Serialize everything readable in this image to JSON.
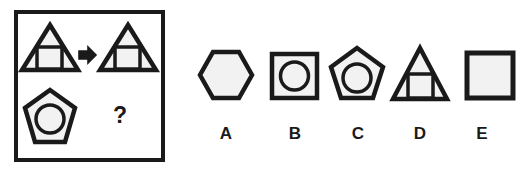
{
  "puzzle": {
    "type": "visual-analogy-matrix",
    "question_mark": "?",
    "stem_box": {
      "x": 14,
      "y": 10,
      "width": 151,
      "height": 152,
      "border_color": "#1a1a1a",
      "border_width": 4,
      "fill": "#ffffff"
    },
    "stem_cells": [
      {
        "position": "top-left",
        "outer_shape": "triangle",
        "inner_shape": "square",
        "description": "large triangle containing a square"
      },
      {
        "position": "top-right",
        "outer_shape": "triangle",
        "inner_shape": "square",
        "description": "large triangle containing a square"
      },
      {
        "position": "bottom-left",
        "outer_shape": "pentagon",
        "inner_shape": "circle",
        "description": "pentagon containing a circle"
      },
      {
        "position": "bottom-right",
        "outer_shape": "unknown",
        "inner_shape": "unknown",
        "description": "question mark placeholder"
      }
    ],
    "arrow": {
      "glyph": "right-arrow",
      "direction": "right"
    },
    "options": [
      {
        "label": "A",
        "outer_shape": "hexagon",
        "inner_shape": "none",
        "description": "plain hexagon"
      },
      {
        "label": "B",
        "outer_shape": "square",
        "inner_shape": "circle",
        "description": "square containing a circle"
      },
      {
        "label": "C",
        "outer_shape": "pentagon",
        "inner_shape": "circle",
        "description": "pentagon containing a circle"
      },
      {
        "label": "D",
        "outer_shape": "triangle",
        "inner_shape": "square",
        "description": "triangle containing a square"
      },
      {
        "label": "E",
        "outer_shape": "square",
        "inner_shape": "none",
        "description": "plain square"
      }
    ],
    "colors": {
      "stroke": "#1a1a1a",
      "fill": "#f5f5f5",
      "background": "#ffffff",
      "text": "#1a1a1a"
    }
  }
}
